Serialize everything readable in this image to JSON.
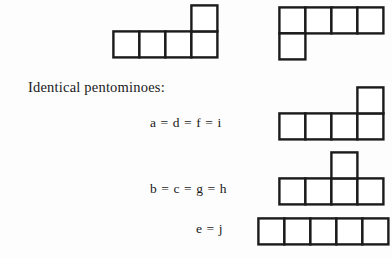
{
  "page": {
    "background_color": "#fdfdfd",
    "ink_color": "#1b1b1b",
    "cell_fill": "#ffffff"
  },
  "caption": {
    "title": "Identical pentominoes:"
  },
  "groups": [
    {
      "id": "group-a",
      "equation": "a = d = f = i",
      "shape_name": "L-pentomino-up-right",
      "cells": [
        [
          0,
          1
        ],
        [
          1,
          1
        ],
        [
          2,
          1
        ],
        [
          3,
          1
        ],
        [
          3,
          0
        ]
      ]
    },
    {
      "id": "group-b",
      "equation": "b = c = g = h",
      "shape_name": "Y-pentomino-bump-third",
      "cells": [
        [
          0,
          1
        ],
        [
          1,
          1
        ],
        [
          2,
          1
        ],
        [
          3,
          1
        ],
        [
          2,
          0
        ]
      ]
    },
    {
      "id": "group-e",
      "equation": "e = j",
      "shape_name": "I-pentomino-straight",
      "cells": [
        [
          0,
          0
        ],
        [
          1,
          0
        ],
        [
          2,
          0
        ],
        [
          3,
          0
        ],
        [
          4,
          0
        ]
      ]
    }
  ],
  "top_shapes": [
    {
      "id": "top-shape-left",
      "shape_name": "L-pentomino-up-right",
      "cells": [
        [
          0,
          1
        ],
        [
          1,
          1
        ],
        [
          2,
          1
        ],
        [
          3,
          1
        ],
        [
          3,
          0
        ]
      ]
    },
    {
      "id": "top-shape-right",
      "shape_name": "J-pentomino-down-left",
      "cells": [
        [
          0,
          0
        ],
        [
          1,
          0
        ],
        [
          2,
          0
        ],
        [
          3,
          0
        ],
        [
          0,
          1
        ]
      ]
    }
  ],
  "geometry": {
    "cell_size": 26,
    "stroke_width": 2.4,
    "top_left_origin": {
      "x": 113,
      "y": 5
    },
    "top_right_origin": {
      "x": 279,
      "y": 7
    },
    "group_a_origin": {
      "x": 279,
      "y": 87
    },
    "group_b_origin": {
      "x": 279,
      "y": 152
    },
    "group_e_origin": {
      "x": 258,
      "y": 218
    }
  }
}
